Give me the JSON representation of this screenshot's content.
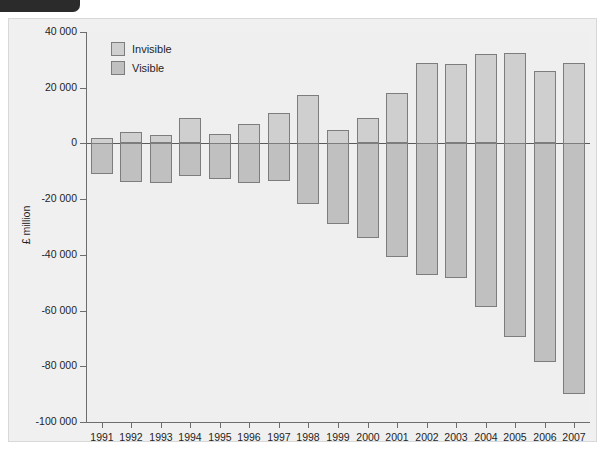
{
  "figure": {
    "corner_tab_label": "",
    "y_axis_title": "£ million"
  },
  "legend": {
    "items": [
      {
        "label": "Invisible",
        "color": "#cfcfcf",
        "key": "invisible"
      },
      {
        "label": "Visible",
        "color": "#c0c0c0",
        "key": "visible"
      }
    ]
  },
  "chart_data": {
    "type": "bar",
    "title": "",
    "xlabel": "",
    "ylabel": "£ million",
    "ylim": [
      -100000,
      40000
    ],
    "ytick_labels": [
      "40 000",
      "20 000",
      "0",
      "-20 000",
      "-40 000",
      "-60 000",
      "-80 000",
      "-100 000"
    ],
    "ytick_values": [
      40000,
      20000,
      0,
      -20000,
      -40000,
      -60000,
      -80000,
      -100000
    ],
    "grid": false,
    "legend_position": "top-left",
    "stacked": false,
    "categories": [
      "1991",
      "1992",
      "1993",
      "1994",
      "1995",
      "1996",
      "1997",
      "1998",
      "1999",
      "2000",
      "2001",
      "2002",
      "2003",
      "2004",
      "2005",
      "2006",
      "2007"
    ],
    "series": [
      {
        "name": "Invisible",
        "color": "#cfcfcf",
        "values": [
          2000,
          4000,
          3000,
          9000,
          3500,
          7000,
          11000,
          17500,
          5000,
          9000,
          18000,
          29000,
          28500,
          32000,
          32500,
          26000,
          29000
        ]
      },
      {
        "name": "Visible",
        "color": "#c0c0c0",
        "values": [
          -11000,
          -14000,
          -14500,
          -12000,
          -13000,
          -14500,
          -13500,
          -22000,
          -29000,
          -34000,
          -41000,
          -47500,
          -48500,
          -59000,
          -69500,
          -78500,
          -90000
        ]
      }
    ]
  }
}
